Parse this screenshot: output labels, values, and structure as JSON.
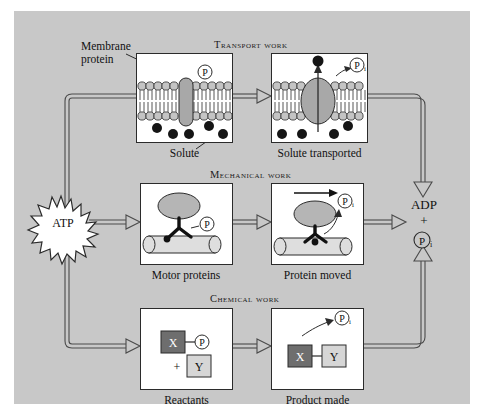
{
  "figure": {
    "background_color": "#c8c8c8",
    "panel_color": "#ffffff",
    "line_color": "#3a3a3a"
  },
  "nodes": {
    "atp": "ATP",
    "adp": "ADP",
    "plus": "+",
    "pi_symbol": "P",
    "pi_subscript": "i"
  },
  "rows": [
    {
      "heading": "Transport work",
      "left_caption": "Solute",
      "right_caption": "Solute transported",
      "annotation": "Membrane\nprotein",
      "annotation_line1": "Membrane",
      "annotation_line2": "protein"
    },
    {
      "heading": "Mechanical work",
      "left_caption": "Motor proteins",
      "right_caption": "Protein moved"
    },
    {
      "heading": "Chemical work",
      "left_caption": "Reactants",
      "right_caption": "Product made"
    }
  ],
  "chemical": {
    "reactant_x": "X",
    "reactant_y": "Y",
    "plus_sign": "+",
    "product_x": "X",
    "product_y": "Y"
  },
  "colors": {
    "protein_fill": "#a8a8a8",
    "solute_fill": "#151515",
    "lipid_head": "#c4c4c4",
    "x_box": "#6e6e6e",
    "y_box": "#d6d6d6",
    "filament": "#dedede"
  }
}
